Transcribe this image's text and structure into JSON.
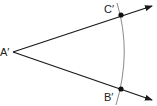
{
  "diagram": {
    "colors": {
      "ray": "#1a1a1a",
      "arc": "#8a8a8a",
      "point": "#111111",
      "label": "#222222"
    },
    "vertex": {
      "label": "A′",
      "x": 13,
      "y": 52
    },
    "rays": [
      {
        "name": "ray-upper",
        "from": "A′",
        "through": "C′"
      },
      {
        "name": "ray-lower",
        "from": "A′",
        "through": "B′"
      }
    ],
    "points": [
      {
        "label": "C′",
        "x": 120,
        "y": 15
      },
      {
        "label": "B′",
        "x": 121,
        "y": 89
      }
    ],
    "arc": {
      "description": "arc centered at A′ intersecting both rays"
    }
  }
}
